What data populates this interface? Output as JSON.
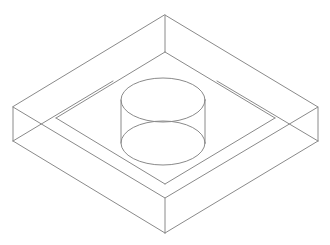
{
  "drawing": {
    "title": "Isometric wireframe of rectangular slab with central cylindrical boss",
    "type": "isometric-wireframe",
    "background_color": "#ffffff",
    "line_color": "#8a8a8a",
    "line_width": 1,
    "canvas": {
      "width": 330,
      "height": 245
    },
    "parts": [
      {
        "name": "outer-slab",
        "label": "Rectangular slab (base plate)",
        "top_face_vertices": [
          [
            165,
            15
          ],
          [
            318,
            107
          ],
          [
            165,
            198
          ],
          [
            13,
            107
          ]
        ],
        "thickness_px": 35,
        "visible_side_faces": [
          "front-left",
          "front-right"
        ],
        "vertical_edges": [
          {
            "name": "left-corner-edge",
            "from": [
              13,
              107
            ],
            "to": [
              13,
              141
            ]
          },
          {
            "name": "front-corner-edge",
            "from": [
              165,
              198
            ],
            "to": [
              165,
              233
            ]
          },
          {
            "name": "right-corner-edge",
            "from": [
              318,
              107
            ],
            "to": [
              318,
              141
            ]
          }
        ],
        "bottom_face_visible_edges": [
          {
            "from": [
              13,
              141
            ],
            "to": [
              165,
              233
            ]
          },
          {
            "from": [
              165,
              233
            ],
            "to": [
              318,
              141
            ]
          }
        ],
        "hidden_construction_edges": [
          {
            "from": [
              13,
              107
            ],
            "to": [
              165,
              198
            ]
          },
          {
            "from": [
              318,
              107
            ],
            "to": [
              165,
              198
            ]
          },
          {
            "from": [
              13,
              141
            ],
            "to": [
              113,
              81
            ]
          },
          {
            "from": [
              318,
              141
            ],
            "to": [
              217,
              81
            ]
          }
        ]
      },
      {
        "name": "inner-rim",
        "label": "Recessed inner platform rim",
        "top_face_vertices": [
          [
            165,
            52
          ],
          [
            275,
            118
          ],
          [
            165,
            184
          ],
          [
            56,
            118
          ]
        ],
        "corner_edge": {
          "name": "inner-back-corner-edge",
          "from": [
            165,
            15
          ],
          "to": [
            165,
            52
          ]
        }
      },
      {
        "name": "center-cylinder",
        "label": "Central cylindrical boss",
        "center_x": 163,
        "top_ellipse": {
          "cx": 163,
          "cy": 100,
          "rx": 42,
          "ry": 22
        },
        "bottom_ellipse": {
          "cx": 163,
          "cy": 143,
          "rx": 42,
          "ry": 22
        },
        "height_px": 43,
        "silhouette_lines": [
          {
            "name": "left-silhouette",
            "from": [
              121,
              100
            ],
            "to": [
              121,
              143
            ]
          },
          {
            "name": "right-silhouette",
            "from": [
              205,
              100
            ],
            "to": [
              205,
              143
            ]
          }
        ]
      }
    ]
  }
}
